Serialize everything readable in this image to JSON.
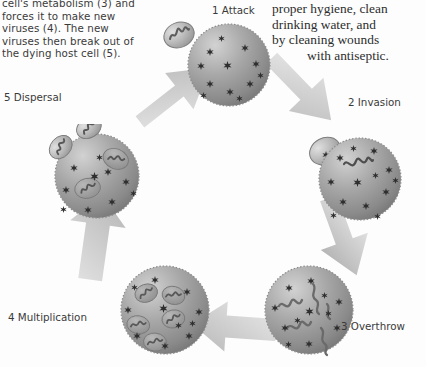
{
  "figure": {
    "background_color": "#fdfdfd",
    "cell_color": "#9a9a9a",
    "arrow_color": "#cfcfcf"
  },
  "caption_left": {
    "lines": [
      "cell's metabolism (3) and",
      "forces it to make new",
      "viruses (4). The new",
      "viruses then break out of",
      "the dying host cell (5)."
    ],
    "text": "cell's metabolism (3) and forces it to make new viruses (4). The new viruses then break out of the dying host cell (5)."
  },
  "caption_right": {
    "lines": [
      "proper hygiene, clean",
      "drinking water, and",
      "by cleaning wounds"
    ],
    "last_line": "with antiseptic.",
    "text": "proper hygiene, clean drinking water, and by cleaning wounds with antiseptic."
  },
  "stages": [
    {
      "id": "attack",
      "number": "1",
      "name": "Attack",
      "label": "1 Attack"
    },
    {
      "id": "invasion",
      "number": "2",
      "name": "Invasion",
      "label": "2 Invasion"
    },
    {
      "id": "overthrow",
      "number": "3",
      "name": "Overthrow",
      "label": "3 Overthrow"
    },
    {
      "id": "multiplication",
      "number": "4",
      "name": "Multiplication",
      "label": "4 Multiplication"
    },
    {
      "id": "dispersal",
      "number": "5",
      "name": "Dispersal",
      "label": "5 Dispersal"
    }
  ],
  "arrows": [
    {
      "id": "arrow-5-to-1",
      "from": "dispersal",
      "to": "attack",
      "direction": "up-right"
    },
    {
      "id": "arrow-1-to-2",
      "from": "attack",
      "to": "invasion",
      "direction": "down-right"
    },
    {
      "id": "arrow-2-to-3",
      "from": "invasion",
      "to": "overthrow",
      "direction": "down"
    },
    {
      "id": "arrow-3-to-4",
      "from": "overthrow",
      "to": "multiplication",
      "direction": "left"
    },
    {
      "id": "arrow-4-to-5",
      "from": "multiplication",
      "to": "dispersal",
      "direction": "up"
    }
  ]
}
